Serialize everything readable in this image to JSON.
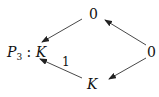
{
  "diagram": {
    "nodes": {
      "top": {
        "label": "0"
      },
      "left": {
        "prefix": "P",
        "subscript": "3",
        "sep": " : ",
        "label": "K"
      },
      "right": {
        "label": "0"
      },
      "bottom": {
        "label": "K"
      }
    },
    "edges": [
      {
        "from": "top",
        "to": "left",
        "label": ""
      },
      {
        "from": "right",
        "to": "top",
        "label": ""
      },
      {
        "from": "bottom",
        "to": "left",
        "label": "1"
      },
      {
        "from": "right",
        "to": "bottom",
        "label": ""
      }
    ],
    "edge_label_1": "1"
  }
}
